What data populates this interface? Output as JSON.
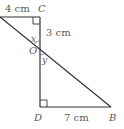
{
  "diagram": {
    "type": "geometry",
    "points": {
      "C": {
        "label": "C",
        "x": 40,
        "y": 17
      },
      "O": {
        "label": "O",
        "x": 40,
        "y": 48
      },
      "D": {
        "label": "D",
        "x": 40,
        "y": 107
      },
      "B": {
        "label": "B",
        "x": 111,
        "y": 107
      },
      "A": {
        "label": "",
        "x": 0,
        "y": 17
      }
    },
    "measurements": {
      "top_segment": "4 cm",
      "co_segment": "3 cm",
      "db_segment": "7 cm"
    },
    "angles": {
      "upper": "x",
      "lower": "y"
    },
    "right_angles": [
      "C",
      "D"
    ],
    "colors": {
      "line": "#333333",
      "text": "#5a5a5a"
    }
  }
}
